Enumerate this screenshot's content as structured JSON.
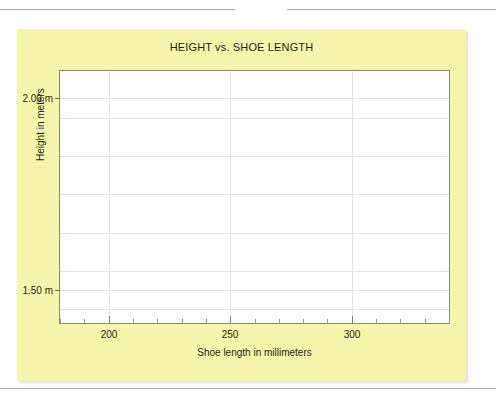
{
  "page": {
    "background_color": "#ffffff",
    "dividers": [
      {
        "name": "top-left-rule",
        "color": "#aeaeb2"
      },
      {
        "name": "top-right-rule",
        "color": "#aeaeb2"
      },
      {
        "name": "bottom-rule",
        "color": "#aeaeb2"
      }
    ]
  },
  "figure": {
    "panel_color": "#f7f5ab",
    "plot_background": "#ffffff",
    "plot_border_color": "#8d8a5e",
    "gridline_color": "#e2e2e2"
  },
  "chart_data": {
    "type": "scatter",
    "title": "HEIGHT vs. SHOE LENGTH",
    "xlabel": "Shoe length in millimeters",
    "ylabel": "Height in meters",
    "xlim": [
      180,
      340
    ],
    "ylim": [
      1.4142,
      2.0714
    ],
    "grid": true,
    "legend": null,
    "x_ticks": [
      200,
      250,
      300
    ],
    "x_tick_labels": [
      "200",
      "250",
      "300"
    ],
    "x_minor_tick_step": 10,
    "y_ticks": [
      1.5,
      2.0
    ],
    "y_tick_labels": [
      "1.50 m",
      "2.00 m"
    ],
    "y_gridlines": [
      1.45,
      1.5,
      1.55,
      1.65,
      1.75,
      1.85,
      1.95,
      2.0
    ],
    "series": [
      {
        "name": "observations",
        "x": [],
        "y": []
      }
    ],
    "points": [],
    "note": "Empty plot frame: axes, gridlines and labels are drawn but no data points are plotted."
  }
}
